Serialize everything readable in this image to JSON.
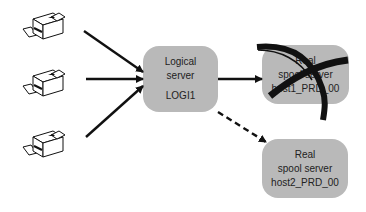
{
  "diagram": {
    "logical_server": {
      "line1": "Logical",
      "line2": "server",
      "id": "LOGI1"
    },
    "real_server_1": {
      "line1": "Real",
      "line2": "spool server",
      "host": "host1_PRD_00",
      "status": "crossed-out"
    },
    "real_server_2": {
      "line1": "Real",
      "line2": "spool server",
      "host": "host2_PRD_00"
    },
    "printers": [
      {
        "name": "printer-1"
      },
      {
        "name": "printer-2"
      },
      {
        "name": "printer-3"
      }
    ],
    "edges": [
      {
        "from": "printer-1",
        "to": "logical_server",
        "style": "solid"
      },
      {
        "from": "printer-2",
        "to": "logical_server",
        "style": "solid"
      },
      {
        "from": "printer-3",
        "to": "logical_server",
        "style": "solid"
      },
      {
        "from": "logical_server",
        "to": "real_server_1",
        "style": "solid"
      },
      {
        "from": "logical_server",
        "to": "real_server_2",
        "style": "dashed"
      }
    ],
    "colors": {
      "box": "#b9b9b9",
      "arrow": "#111111",
      "text": "#222222"
    }
  }
}
